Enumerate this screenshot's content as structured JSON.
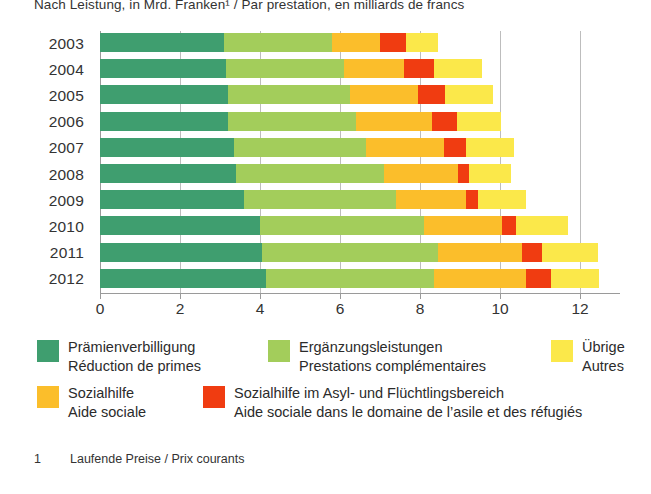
{
  "chart_data": {
    "type": "bar",
    "orientation": "horizontal",
    "stacked": true,
    "title": "Nach Leistung, in Mrd. Franken¹ / Par prestation, en milliards de francs",
    "xlabel": "",
    "ylabel": "",
    "xlim": [
      0,
      13
    ],
    "xticks": [
      0,
      2,
      4,
      6,
      8,
      10,
      12
    ],
    "xticklabels": [
      "0",
      "2",
      "4",
      "6",
      "8",
      "10",
      "12"
    ],
    "grid": true,
    "legend_position": "bottom",
    "categories": [
      "2003",
      "2004",
      "2005",
      "2006",
      "2007",
      "2008",
      "2009",
      "2010",
      "2011",
      "2012"
    ],
    "series": [
      {
        "name": "Prämienverbilligung",
        "name_fr": "Réduction de primes",
        "color": "#3f9e6f",
        "values": [
          3.1,
          3.15,
          3.2,
          3.2,
          3.35,
          3.4,
          3.6,
          4.0,
          4.05,
          4.15
        ]
      },
      {
        "name": "Ergänzungsleistungen",
        "name_fr": "Prestations complémentaires",
        "color": "#a3cd5b",
        "values": [
          2.7,
          2.95,
          3.05,
          3.2,
          3.3,
          3.7,
          3.8,
          4.1,
          4.4,
          4.2
        ]
      },
      {
        "name": "Sozialhilfe",
        "name_fr": "Aide sociale",
        "color": "#fbbe2b",
        "values": [
          1.2,
          1.5,
          1.7,
          1.9,
          1.95,
          1.85,
          1.75,
          1.95,
          2.1,
          2.3
        ]
      },
      {
        "name": "Sozialhilfe im Asyl- und Flüchtlingsbereich",
        "name_fr": "Aide sociale dans le domaine de l’asile et des réfugiés",
        "color": "#f03c11",
        "values": [
          0.65,
          0.75,
          0.68,
          0.62,
          0.55,
          0.28,
          0.3,
          0.35,
          0.5,
          0.62
        ]
      },
      {
        "name": "Übrige",
        "name_fr": "Autres",
        "color": "#fbe84a",
        "values": [
          0.8,
          1.2,
          1.2,
          1.1,
          1.2,
          1.05,
          1.2,
          1.3,
          1.4,
          1.2
        ]
      }
    ],
    "totals": [
      8.45,
      9.55,
      9.83,
      10.02,
      10.35,
      10.28,
      10.65,
      11.7,
      12.45,
      12.47
    ]
  },
  "title": "Nach Leistung, in Mrd. Franken¹ / Par prestation, en milliards de francs",
  "legend": {
    "row1": [
      {
        "color_key": "green-dark",
        "line1": "Prämienverbilligung",
        "line2": "Réduction de primes"
      },
      {
        "color_key": "green-light",
        "line1": "Ergänzungsleistungen",
        "line2": "Prestations complémentaires"
      },
      {
        "color_key": "yellow",
        "line1": "Übrige",
        "line2": "Autres"
      }
    ],
    "row2": [
      {
        "color_key": "orange",
        "line1": "Sozialhilfe",
        "line2": "Aide sociale"
      },
      {
        "color_key": "red",
        "line1": "Sozialhilfe im Asyl- und Flüchtlingsbereich",
        "line2": "Aide sociale dans le domaine de l’asile et des réfugiés"
      }
    ]
  },
  "footnote": {
    "marker": "1",
    "text": "Laufende Preise / Prix courants"
  },
  "colors": {
    "green-dark": "#3f9e6f",
    "green-light": "#a3cd5b",
    "yellow": "#fbe84a",
    "orange": "#fbbe2b",
    "red": "#f03c11",
    "gridline": "#bdbdbd",
    "axis": "#9a9a9a",
    "text": "#2b2b2b"
  }
}
